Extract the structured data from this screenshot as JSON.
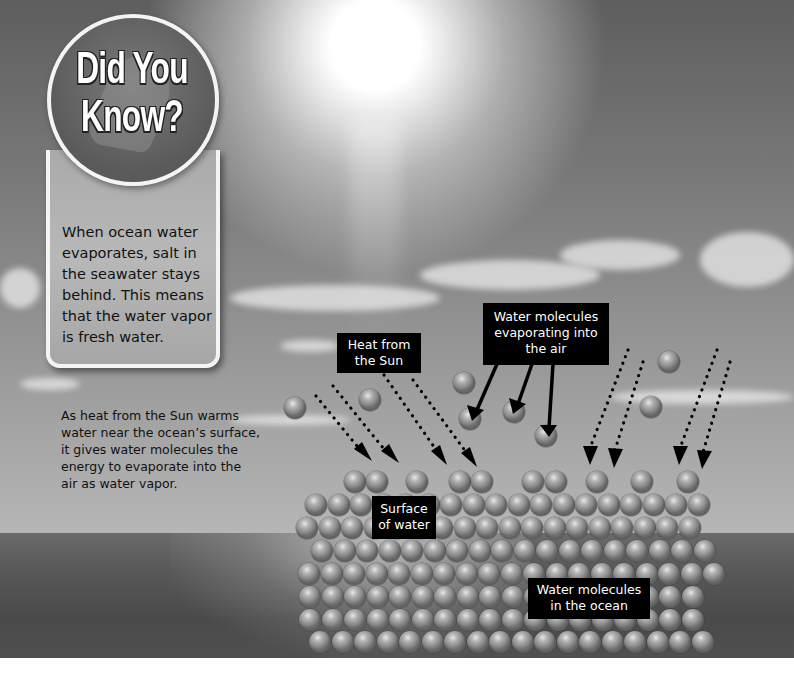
{
  "callout": {
    "title_line1": "Did You",
    "title_line2": "Know?",
    "body": "When ocean water evaporates, salt in the seawater stays behind. This means that the water vapor is fresh water."
  },
  "caption": "As heat from the Sun warms water near the ocean’s surface, it gives water molecules the energy to evaporate into the air as water vapor.",
  "labels": {
    "heat": "Heat from the Sun",
    "evaporating": "Water molecules evaporating into the air",
    "surface": "Surface of water",
    "ocean": "Water molecules in the ocean"
  },
  "colors": {
    "label_bg": "#000000",
    "label_text": "#ffffff",
    "callout_border": "#f4f4f4",
    "callout_circle": "#6a6a6a",
    "callout_box": "#b0b0b0"
  },
  "icons": {
    "sun": "sun-glow",
    "heat_arrow": "dotted-arrow",
    "evaporation_arrow": "solid-arrow",
    "molecule": "water-molecule-sphere"
  }
}
